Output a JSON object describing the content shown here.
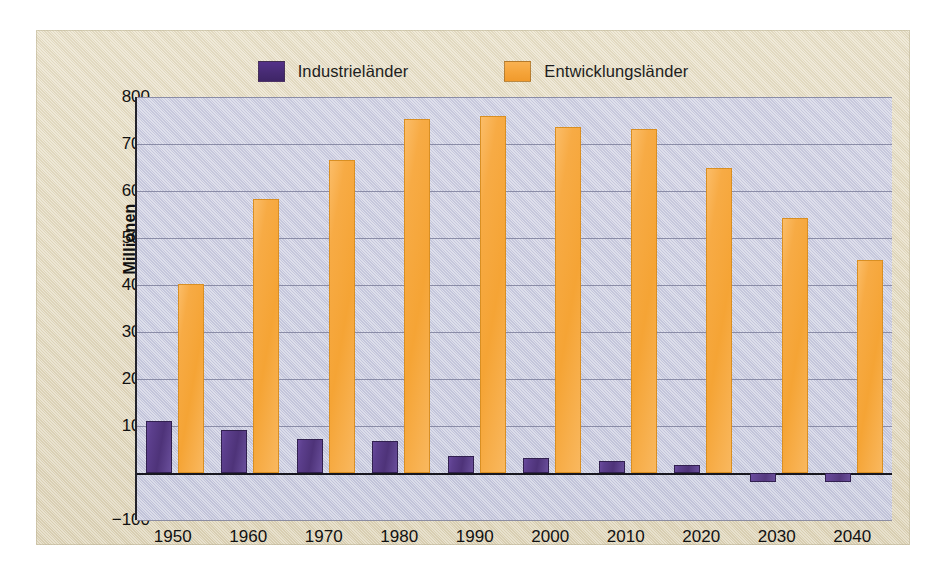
{
  "figure": {
    "panel_background": "#e5dcc2",
    "plot_background": "#ccccdd"
  },
  "legend": {
    "position": "top-center",
    "entries": [
      {
        "label": "Industrieländer",
        "color": "#4a2d7a",
        "icon": "legend-swatch-icon"
      },
      {
        "label": "Entwicklungsländer",
        "color": "#f5a73c",
        "icon": "legend-swatch-icon"
      }
    ]
  },
  "chart_data": {
    "type": "bar",
    "title": "",
    "xlabel": "",
    "ylabel": "Millionen",
    "categories": [
      "1950",
      "1960",
      "1970",
      "1980",
      "1990",
      "2000",
      "2010",
      "2020",
      "2030",
      "2040"
    ],
    "series": [
      {
        "name": "Industrieländer",
        "color": "#4a2d7a",
        "values": [
          110,
          92,
          73,
          69,
          37,
          32,
          26,
          17,
          -20,
          -20
        ]
      },
      {
        "name": "Entwicklungsländer",
        "color": "#f5a73c",
        "values": [
          403,
          582,
          665,
          753,
          760,
          737,
          731,
          650,
          542,
          453
        ]
      }
    ],
    "ylim": [
      -100,
      800
    ],
    "yticks": [
      800,
      700,
      600,
      500,
      400,
      300,
      200,
      100,
      0,
      -100
    ],
    "ytick_labels": [
      "800",
      "700",
      "600",
      "500",
      "400",
      "300",
      "200",
      "100",
      "0",
      "−100"
    ],
    "grid": true,
    "grid_axis": "y",
    "legend_position": "top-center"
  }
}
